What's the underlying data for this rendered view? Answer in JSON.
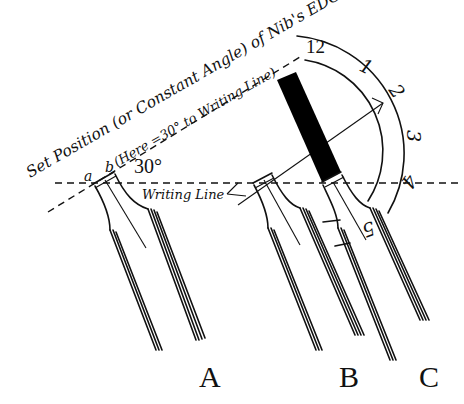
{
  "diagram": {
    "title_line1": "Set Position (or Constant Angle) of Nib's EDGE",
    "title_line2": "(Here =30° to Writing Line)",
    "angle_label": "30°",
    "nib_edge_labels": {
      "a": "a",
      "b": "b"
    },
    "writing_line_label": "Writing Line",
    "clock_numbers": [
      "12",
      "1",
      "2",
      "3",
      "4",
      "5"
    ],
    "nib_labels": [
      "A",
      "B",
      "C"
    ],
    "angle_degrees": 30,
    "colors": {
      "ink": "#111111",
      "background": "#ffffff",
      "nib_shaft_fill": "#000000"
    }
  }
}
